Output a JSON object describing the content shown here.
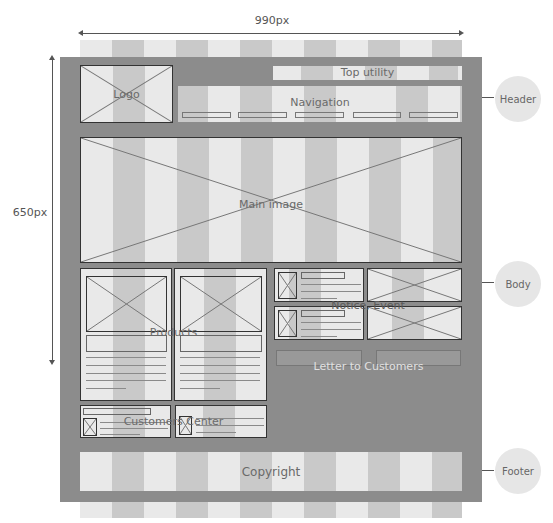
{
  "dimensions": {
    "width_label": "990px",
    "height_label": "650px"
  },
  "header": {
    "logo_label": "Logo",
    "top_utility_label": "Top utility",
    "navigation_label": "Navigation",
    "nav_items_count": 5
  },
  "body": {
    "main_image_label": "Main image",
    "products_label": "Products",
    "notice_event_label": "Notice, Event",
    "letter_label": "Letter to Customers",
    "customers_center_label": "Customers Center"
  },
  "footer": {
    "copyright_label": "Copyright"
  },
  "sections": [
    {
      "label": "Header"
    },
    {
      "label": "Body"
    },
    {
      "label": "Footer"
    }
  ],
  "colors": {
    "frame": "#8c8c8c",
    "stripe_light": "#e9e9e9",
    "stripe_dark": "#c9c9c9",
    "section_circle": "#e6e6e6"
  }
}
